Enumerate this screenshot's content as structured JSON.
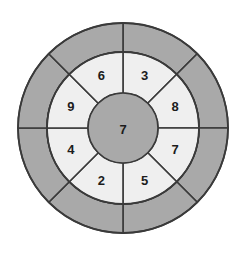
{
  "figure": {
    "background_color": "#ffffff",
    "stroke_color": "#3a3a3a",
    "dark_fill": "#a9a9a9",
    "light_fill": "#efefef",
    "text_color": "#1c1c1c"
  },
  "geometry": {
    "center_x": 123,
    "center_y": 128,
    "outer_radius": 105,
    "middle_radius": 76,
    "inner_radius": 35,
    "sector_count": 8,
    "sector_span_degrees": 45,
    "sector_offset_degrees": 0
  },
  "chart_data": {
    "type": "pie",
    "xlabel": "",
    "ylabel": "",
    "legend": "none",
    "grid": false,
    "rings": [
      {
        "name": "outer-ring",
        "fill": "#a9a9a9",
        "inner_radius": 76,
        "outer_radius": 105,
        "sector_count": 8,
        "labels": [
          "",
          "",
          "",
          "",
          "",
          "",
          "",
          ""
        ]
      },
      {
        "name": "middle-ring",
        "fill": "#efefef",
        "inner_radius": 35,
        "outer_radius": 76,
        "sector_count": 8,
        "labels": [
          "3",
          "8",
          "7",
          "5",
          "2",
          "4",
          "9",
          "6"
        ]
      },
      {
        "name": "center-disc",
        "fill": "#a9a9a9",
        "inner_radius": 0,
        "outer_radius": 35,
        "sector_count": 1,
        "labels": [
          "7"
        ]
      }
    ],
    "categories": [
      "NNE",
      "ENE",
      "ESE",
      "SSE",
      "SSW",
      "WSW",
      "WNW",
      "NNW"
    ],
    "values": [
      3,
      8,
      7,
      5,
      2,
      4,
      9,
      6
    ],
    "center_value": 7
  },
  "middle_ring_sectors": [
    {
      "id": "sector-nne",
      "label": "3",
      "start_angle": 0,
      "end_angle": 45,
      "position": "top-right"
    },
    {
      "id": "sector-ene",
      "label": "8",
      "start_angle": 45,
      "end_angle": 90,
      "position": "right-upper"
    },
    {
      "id": "sector-ese",
      "label": "7",
      "start_angle": 90,
      "end_angle": 135,
      "position": "right-lower"
    },
    {
      "id": "sector-sse",
      "label": "5",
      "start_angle": 135,
      "end_angle": 180,
      "position": "bottom-right"
    },
    {
      "id": "sector-ssw",
      "label": "2",
      "start_angle": 180,
      "end_angle": 225,
      "position": "bottom-left"
    },
    {
      "id": "sector-wsw",
      "label": "4",
      "start_angle": 225,
      "end_angle": 270,
      "position": "left-lower"
    },
    {
      "id": "sector-wnw",
      "label": "9",
      "start_angle": 270,
      "end_angle": 315,
      "position": "left-upper"
    },
    {
      "id": "sector-nnw",
      "label": "6",
      "start_angle": 315,
      "end_angle": 360,
      "position": "top-left"
    }
  ],
  "outer_ring_sectors": [
    {
      "id": "outer-sector-1",
      "label": "",
      "start_angle": 0,
      "end_angle": 45
    },
    {
      "id": "outer-sector-2",
      "label": "",
      "start_angle": 45,
      "end_angle": 90
    },
    {
      "id": "outer-sector-3",
      "label": "",
      "start_angle": 90,
      "end_angle": 135
    },
    {
      "id": "outer-sector-4",
      "label": "",
      "start_angle": 135,
      "end_angle": 180
    },
    {
      "id": "outer-sector-5",
      "label": "",
      "start_angle": 180,
      "end_angle": 225
    },
    {
      "id": "outer-sector-6",
      "label": "",
      "start_angle": 225,
      "end_angle": 270
    },
    {
      "id": "outer-sector-7",
      "label": "",
      "start_angle": 270,
      "end_angle": 315
    },
    {
      "id": "outer-sector-8",
      "label": "",
      "start_angle": 315,
      "end_angle": 360
    }
  ],
  "center": {
    "id": "center-disc",
    "label": "7"
  }
}
